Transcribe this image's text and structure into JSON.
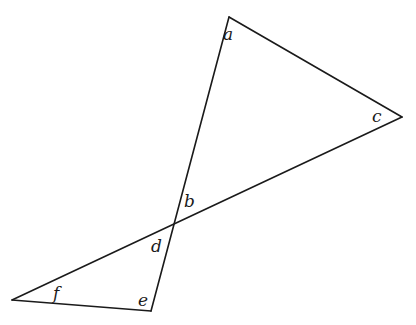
{
  "diagram": {
    "type": "geometry",
    "vertices": {
      "top": [
        229,
        17
      ],
      "right": [
        402,
        117
      ],
      "bottom_left": [
        12,
        300
      ],
      "bottom": [
        151,
        311
      ],
      "intersection": [
        174,
        224
      ]
    },
    "angle_labels": [
      {
        "id": "a",
        "text": "a",
        "x": 223,
        "y": 40
      },
      {
        "id": "c",
        "text": "c",
        "x": 372,
        "y": 122
      },
      {
        "id": "b",
        "text": "b",
        "x": 184,
        "y": 207
      },
      {
        "id": "d",
        "text": "d",
        "x": 151,
        "y": 252
      },
      {
        "id": "f",
        "text": "f",
        "x": 53,
        "y": 299
      },
      {
        "id": "e",
        "text": "e",
        "x": 138,
        "y": 306
      }
    ]
  }
}
